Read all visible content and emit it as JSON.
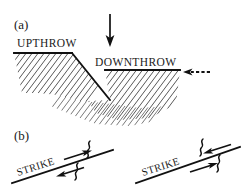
{
  "figure": {
    "background_color": "#ffffff",
    "ink_color": "#111111",
    "hatch_color": "#3a3a3a",
    "width": 247,
    "height": 189
  },
  "panel_a": {
    "label": "(a)",
    "type": "dip-slip fault cross-section",
    "upthrow_label": "UPTHROW",
    "downthrow_label": "DOWNTHROW",
    "vertical_arrow": {
      "name": "downward-motion-arrow",
      "direction": "down",
      "style": "solid"
    },
    "horizontal_arrow": {
      "name": "extension-arrow",
      "direction": "left",
      "style": "dashed"
    }
  },
  "panel_b": {
    "label": "(b)",
    "type": "strike-slip fault map views",
    "faults": [
      {
        "name": "left-lateral-strike-slip",
        "strike_label": "STRIKE",
        "upper_arrow_direction": "right",
        "lower_arrow_direction": "left",
        "squiggle_count": 2
      },
      {
        "name": "right-lateral-strike-slip",
        "strike_label": "STRIKE",
        "upper_arrow_direction": "left",
        "lower_arrow_direction": "right",
        "squiggle_count": 2
      }
    ]
  }
}
